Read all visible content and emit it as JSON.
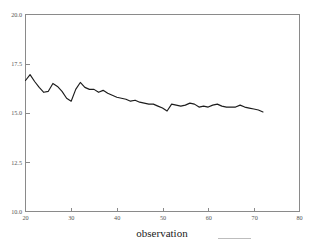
{
  "chart_data": {
    "type": "line",
    "title": "",
    "subtitle": "",
    "xlabel": "observation",
    "ylabel": "",
    "xlim": [
      20,
      80
    ],
    "ylim": [
      10.0,
      20.0
    ],
    "grid": false,
    "legend": null,
    "xticks": [
      20,
      30,
      40,
      50,
      60,
      70,
      80
    ],
    "xticklabels": [
      "20",
      "30",
      "40",
      "50",
      "60",
      "70",
      "80"
    ],
    "yticks": [
      10.0,
      12.5,
      15.0,
      17.5,
      20.0
    ],
    "yticklabels": [
      "10.0",
      "12.5",
      "15.0",
      "17.5",
      "20.0"
    ],
    "line_color": "#1c1c1c",
    "axis_color": "#8a8a8a",
    "series": [
      {
        "name": "observation",
        "x": [
          20,
          21,
          22,
          23,
          24,
          25,
          26,
          27,
          28,
          29,
          30,
          31,
          32,
          33,
          34,
          35,
          36,
          37,
          38,
          39,
          40,
          41,
          42,
          43,
          44,
          45,
          46,
          47,
          48,
          49,
          50,
          51,
          52,
          53,
          54,
          55,
          56,
          57,
          58,
          59,
          60,
          61,
          62,
          63,
          64,
          65,
          66,
          67,
          68,
          69,
          70,
          71,
          72
        ],
        "values": [
          16.65,
          16.95,
          16.6,
          16.3,
          16.05,
          16.1,
          16.5,
          16.35,
          16.1,
          15.75,
          15.6,
          16.2,
          16.55,
          16.3,
          16.2,
          16.2,
          16.05,
          16.15,
          16.0,
          15.9,
          15.8,
          15.75,
          15.7,
          15.6,
          15.65,
          15.55,
          15.5,
          15.45,
          15.45,
          15.35,
          15.25,
          15.1,
          15.45,
          15.4,
          15.35,
          15.4,
          15.5,
          15.45,
          15.3,
          15.35,
          15.3,
          15.4,
          15.45,
          15.35,
          15.3,
          15.3,
          15.3,
          15.4,
          15.3,
          15.25,
          15.2,
          15.15,
          15.05
        ]
      }
    ]
  },
  "axis": {
    "x_title": "observation"
  }
}
